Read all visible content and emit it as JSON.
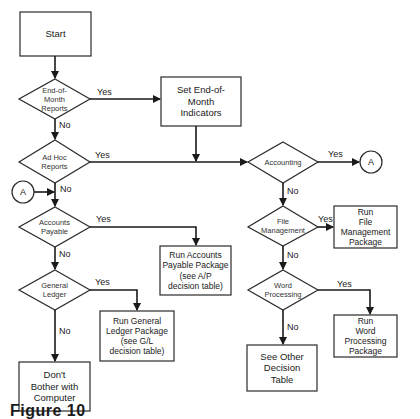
{
  "diagram": {
    "type": "flowchart",
    "caption": "Figure 10",
    "nodes": {
      "start": {
        "shape": "process",
        "label": "Start"
      },
      "eom": {
        "shape": "decision",
        "label": "End-of-\nMonth\nReports"
      },
      "set_eom": {
        "shape": "process",
        "label": "Set End-of-\nMonth\nIndicators"
      },
      "adhoc": {
        "shape": "decision",
        "label": "Ad Hoc\nReports"
      },
      "conn_a_left": {
        "shape": "connector",
        "label": "A"
      },
      "ap": {
        "shape": "decision",
        "label": "Accounts\nPayable"
      },
      "run_ap": {
        "shape": "process",
        "label": "Run Accounts\nPayable Package\n(see A/P\ndecision table)"
      },
      "gl": {
        "shape": "decision",
        "label": "General\nLedger"
      },
      "run_gl": {
        "shape": "process",
        "label": "Run General\nLedger Package\n(see G/L\ndecision table)"
      },
      "dont": {
        "shape": "process",
        "label": "Don't\nBother with\nComputer"
      },
      "accounting": {
        "shape": "decision",
        "label": "Accounting"
      },
      "conn_a_right": {
        "shape": "connector",
        "label": "A"
      },
      "filemgmt": {
        "shape": "decision",
        "label": "File\nManagement"
      },
      "run_fm": {
        "shape": "process",
        "label": "Run\nFile Management\nPackage"
      },
      "wordproc": {
        "shape": "decision",
        "label": "Word\nProcessing"
      },
      "run_wp": {
        "shape": "process",
        "label": "Run\nWord Processing\nPackage"
      },
      "other": {
        "shape": "process",
        "label": "See Other\nDecision\nTable"
      }
    },
    "edges": {
      "eom_yes": "Yes",
      "eom_no": "No",
      "adhoc_yes": "Yes",
      "adhoc_no": "No",
      "ap_yes": "Yes",
      "ap_no": "No",
      "gl_yes": "Yes",
      "gl_no": "No",
      "acc_yes": "Yes",
      "acc_no": "No",
      "fm_yes": "Yes",
      "fm_no": "No",
      "wp_yes": "Yes",
      "wp_no": "No"
    }
  }
}
